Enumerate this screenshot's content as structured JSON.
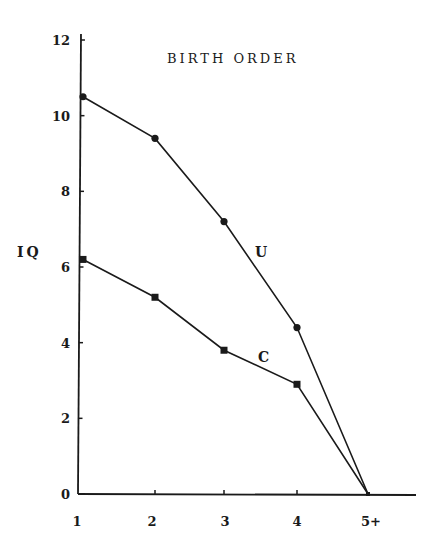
{
  "chart_data": {
    "type": "line",
    "title": "BIRTH ORDER",
    "xlabel": "",
    "ylabel": "IQ",
    "categories": [
      "1",
      "2",
      "3",
      "4",
      "5+"
    ],
    "y_ticks": [
      "0",
      "2",
      "4",
      "6",
      "8",
      "10",
      "12"
    ],
    "ylim": [
      0,
      12
    ],
    "grid": false,
    "legend": "inline labels",
    "series": [
      {
        "name": "U",
        "marker": "circle",
        "values": [
          10.5,
          9.4,
          7.2,
          4.4,
          0
        ]
      },
      {
        "name": "C",
        "marker": "square",
        "values": [
          6.2,
          5.2,
          3.8,
          2.9,
          0
        ]
      }
    ]
  }
}
